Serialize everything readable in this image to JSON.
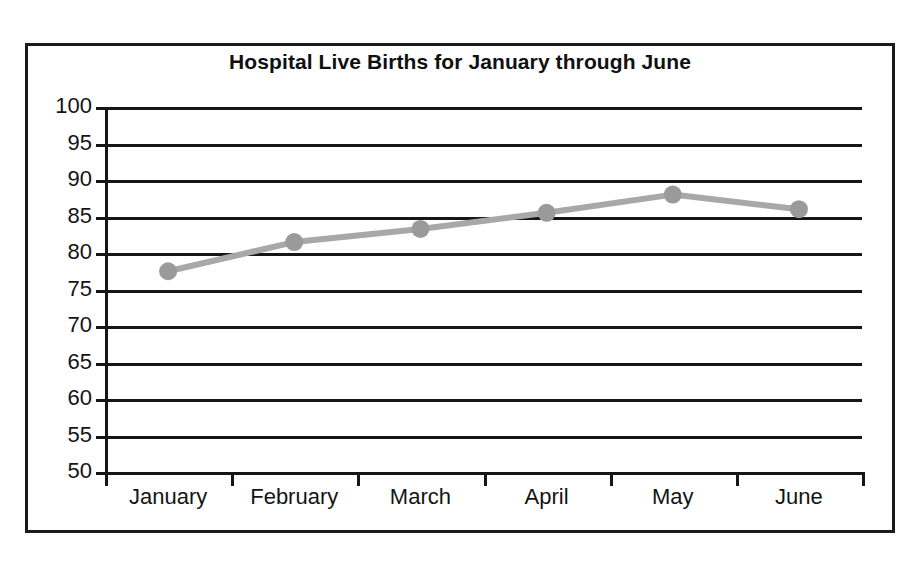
{
  "chart_data": {
    "type": "line",
    "title": "Hospital Live Births for January through June",
    "xlabel": "",
    "ylabel": "",
    "categories": [
      "January",
      "February",
      "March",
      "April",
      "May",
      "June"
    ],
    "values": [
      77.5,
      81.5,
      83.3,
      85.5,
      88,
      86
    ],
    "series": [
      {
        "name": "Hospital Live Births",
        "values": [
          77.5,
          81.5,
          83.3,
          85.5,
          88,
          86
        ]
      }
    ],
    "ylim": [
      50,
      100
    ],
    "ytick_step": 5,
    "yticks": [
      100,
      95,
      90,
      85,
      80,
      75,
      70,
      65,
      60,
      55,
      50
    ],
    "ytick_labels": [
      "100",
      "95",
      "90",
      "85",
      "80",
      "75",
      "70",
      "65",
      "60",
      "55",
      "50"
    ],
    "grid": true,
    "grid_axis": "y",
    "legend": false,
    "legend_position": "none",
    "markers": true,
    "marker_shape": "circle",
    "colors": {
      "line": "#a8a8a8",
      "marker": "#9a9a9a",
      "grid": "#161616",
      "axis": "#161616",
      "frame": "#1a1a1a",
      "title_text": "#101010",
      "tick_text": "#141414",
      "background": "#ffffff"
    }
  }
}
